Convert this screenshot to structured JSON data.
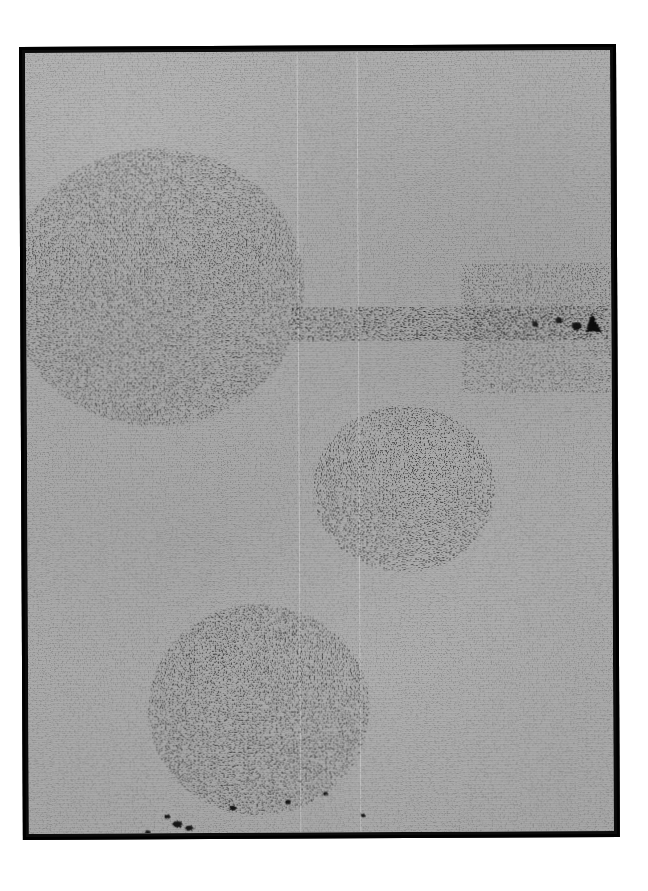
{
  "image": {
    "kind": "scanned-photographic-plate",
    "subject": "astronomical field with three resolved galaxies",
    "orientation_deg": -0.28,
    "plate": {
      "x": 19,
      "y": 47,
      "width": 597,
      "height": 793,
      "border_color": "#000000",
      "border_width_px": 3,
      "background_color": "#a9a9a9",
      "emulsion_grain_color": "#111111"
    },
    "canvas": {
      "width": 648,
      "height": 891,
      "background_color": "#ffffff"
    },
    "scan_seams": [
      {
        "name": "seam-left",
        "x_px": 289
      },
      {
        "name": "seam-right",
        "x_px": 349
      }
    ],
    "objects": [
      {
        "name": "galaxy-upper-left",
        "morphology": "face-on spiral with resolved knotty arms",
        "center": {
          "x": 148,
          "y": 282
        },
        "radius": {
          "x": 118,
          "y": 110
        },
        "core": {
          "x": 140,
          "y": 281,
          "width": 52,
          "height": 16
        },
        "arm_count": 3,
        "density": "filamentary",
        "position_angle_deg": 12
      },
      {
        "name": "galaxy-center",
        "morphology": "compact clumpy spiral",
        "center": {
          "x": 396,
          "y": 484
        },
        "radius": {
          "x": 66,
          "y": 62
        },
        "core": {
          "x": 385,
          "y": 484,
          "width": 34,
          "height": 22
        },
        "arm_count": 2,
        "density": "dense-granular",
        "position_angle_deg": -30
      },
      {
        "name": "galaxy-lower-left",
        "morphology": "dense irregular / barred spiral",
        "center": {
          "x": 250,
          "y": 706
        },
        "radius": {
          "x": 86,
          "y": 84
        },
        "core": {
          "x": 248,
          "y": 706,
          "width": 62,
          "height": 52
        },
        "arm_count": 2,
        "density": "very-dense",
        "position_angle_deg": 20
      }
    ],
    "features": [
      {
        "name": "horizontal-speck-trail",
        "description": "row of small dark specks running to the right edge",
        "y_px": 318,
        "x_start_px": 300,
        "x_end_px": 610
      },
      {
        "name": "edge-blob-right",
        "description": "dark arrowhead-shaped blob near right border",
        "x_px": 596,
        "y_px": 316
      },
      {
        "name": "lower-left-specks",
        "description": "scattered small marks below the lower galaxy",
        "x_px": 175,
        "y_px": 820
      }
    ]
  }
}
